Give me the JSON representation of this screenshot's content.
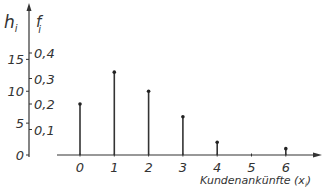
{
  "chart_data": {
    "type": "bar",
    "style": "stem",
    "title": "",
    "xlabel": "Kundenankünfte (x_i)",
    "xlabel_main": "Kundenankünfte (x",
    "xlabel_sub": "i",
    "xlabel_close": ")",
    "ylabel_left": "h_i",
    "ylabel_left_main": "h",
    "ylabel_left_sub": "i",
    "ylabel_right": "f_i",
    "ylabel_right_main": "f",
    "ylabel_right_sub": "i",
    "categories": [
      "0",
      "1",
      "2",
      "3",
      "4",
      "5",
      "6"
    ],
    "series": [
      {
        "name": "h_i (absolute frequency)",
        "values": [
          8,
          13,
          10,
          6,
          2,
          0,
          1
        ]
      },
      {
        "name": "f_i (relative frequency)",
        "values": [
          0.2,
          0.325,
          0.25,
          0.15,
          0.05,
          0.0,
          0.025
        ]
      }
    ],
    "left_ticks": [
      "0",
      "5",
      "10",
      "15"
    ],
    "left_tick_values": [
      0,
      5,
      10,
      15
    ],
    "right_ticks": [
      "0,1",
      "0,2",
      "0,3",
      "0,4"
    ],
    "right_tick_values": [
      0.1,
      0.2,
      0.3,
      0.4
    ],
    "x_ticks": [
      "0",
      "1",
      "2",
      "3",
      "4",
      "5",
      "6"
    ],
    "ylim_f": [
      0,
      0.42
    ],
    "grid": false,
    "legend": "none"
  }
}
